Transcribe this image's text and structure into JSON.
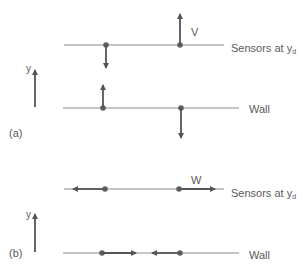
{
  "panels": [
    {
      "id": "a",
      "panel_label": "(a)",
      "axis_label": "y",
      "sensor_line_label": "Sensors at y",
      "sensor_line_subscript": "d",
      "wall_label": "Wall",
      "velocity_label": "V",
      "description": "Normal velocity V: sensor points move opposite to corresponding wall points"
    },
    {
      "id": "b",
      "panel_label": "(b)",
      "axis_label": "y",
      "sensor_line_label": "Sensors at y",
      "sensor_line_subscript": "d",
      "wall_label": "Wall",
      "velocity_label": "W",
      "description": "Spanwise velocity W: sensor points move outward, wall points move inward"
    }
  ],
  "colors": {
    "line": "#8a8a8a",
    "arrow": "#555555",
    "dot": "#5f5f5f",
    "text": "#5a5a5a"
  }
}
